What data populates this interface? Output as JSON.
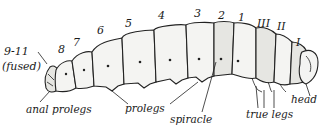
{
  "diagram": {
    "segment_labels": {
      "abdominal": [
        "9-11",
        "8",
        "7",
        "6",
        "5",
        "4",
        "3",
        "2",
        "1"
      ],
      "fused_note": "(fused)",
      "thoracic": [
        "III",
        "II",
        "I"
      ]
    },
    "part_labels": {
      "anal_prolegs": "anal prolegs",
      "prolegs": "prolegs",
      "spiracle": "spiracle",
      "true_legs": "true legs",
      "head": "head"
    },
    "colors": {
      "ink": "#222222",
      "body_fill": "#f4f4f2",
      "background": "#ffffff"
    }
  }
}
